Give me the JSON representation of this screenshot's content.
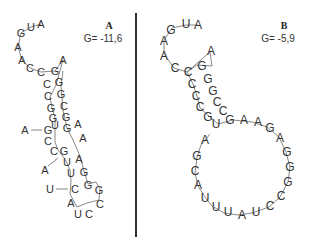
{
  "panels": [
    {
      "label": "A",
      "energy_label": "G= -11,6",
      "structure": {
        "five_prime_tail": [
          "A",
          "U",
          "G",
          "A",
          "A",
          "C"
        ],
        "stem1_left": [
          "C",
          "C",
          "C",
          "G",
          "G"
        ],
        "stem1_right": [
          "G",
          "G",
          "G",
          "C",
          "G"
        ],
        "hairpin_tip_A": "A",
        "internal_loop_left_bulge": "A",
        "internal_loop": [
          "U",
          "G",
          "G",
          "C",
          "C",
          "G",
          "A",
          "A"
        ],
        "stem2": [
          "U",
          "U",
          "A",
          "G"
        ],
        "bulge_A2": "A",
        "bulge_U": "U",
        "terminal_loop": [
          "C",
          "G",
          "G",
          "C",
          "C",
          "U",
          "A"
        ]
      }
    },
    {
      "label": "B",
      "energy_label": "G= -5,9",
      "structure": {
        "five_prime_tail": [
          "A",
          "U",
          "G",
          "A",
          "A",
          "C"
        ],
        "stem_left": [
          "C",
          "C",
          "C",
          "C",
          "G"
        ],
        "stem_right": [
          "G",
          "G",
          "G",
          "C",
          "C"
        ],
        "hairpin_tip_A": "A",
        "large_loop": [
          "U",
          "G",
          "A",
          "A",
          "G",
          "A",
          "G",
          "G",
          "G",
          "C",
          "C",
          "U",
          "A",
          "U",
          "U",
          "U",
          "A",
          "C",
          "G",
          "A"
        ]
      }
    }
  ],
  "divider": {
    "color": "#333333"
  }
}
